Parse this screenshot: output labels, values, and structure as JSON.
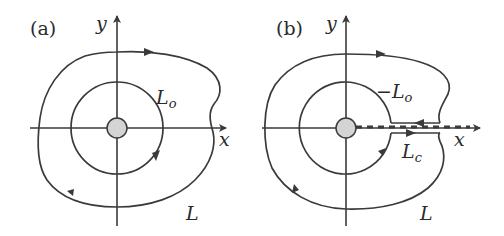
{
  "figure": {
    "panels": [
      {
        "id": "a",
        "label": "(a)",
        "x_axis": "x",
        "y_axis": "y",
        "inner_contour": "L",
        "inner_contour_sub": "o",
        "outer_contour": "L"
      },
      {
        "id": "b",
        "label": "(b)",
        "x_axis": "x",
        "y_axis": "y",
        "inner_contour": "−L",
        "inner_contour_sub": "o",
        "cut_contour": "L",
        "cut_contour_sub": "c",
        "outer_contour": "L"
      }
    ],
    "colors": {
      "stroke": "#3a3a3a",
      "disk_fill": "#d4d4d4",
      "background": "#ffffff"
    }
  }
}
